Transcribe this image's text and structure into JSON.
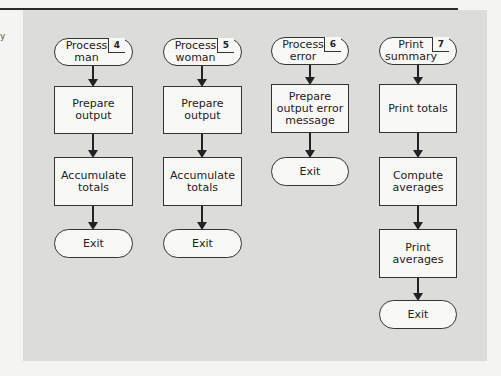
{
  "margin_mark": "y",
  "colors": {
    "panel": "#dcdcda",
    "node_fill": "#f8f8f6",
    "stroke": "#333333",
    "rule": "#2a2a2a"
  },
  "columns": [
    {
      "start": {
        "label": "Process\nman",
        "number": "4"
      },
      "steps": [
        "Prepare\noutput",
        "Accumulate\ntotals"
      ],
      "end": "Exit"
    },
    {
      "start": {
        "label": "Process\nwoman",
        "number": "5"
      },
      "steps": [
        "Prepare\noutput",
        "Accumulate\ntotals"
      ],
      "end": "Exit"
    },
    {
      "start": {
        "label": "Process\nerror",
        "number": "6"
      },
      "steps": [
        "Prepare\noutput error\nmessage"
      ],
      "end": "Exit"
    },
    {
      "start": {
        "label": "Print\nsummary",
        "number": "7"
      },
      "steps": [
        "Print totals",
        "Compute\naverages",
        "Print\naverages"
      ],
      "end": "Exit"
    }
  ]
}
